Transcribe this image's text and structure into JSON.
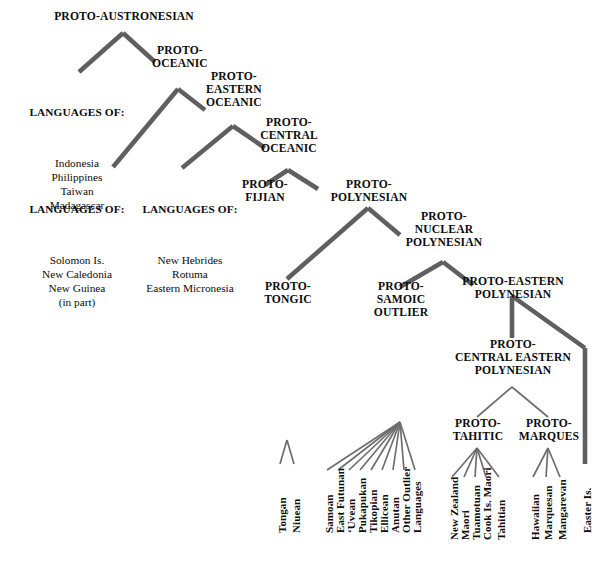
{
  "colors": {
    "background": "#ffffff",
    "text": "#0d0d0d",
    "thick_line": "#5f5f5f",
    "thin_line": "#6e6e6e"
  },
  "nodes": {
    "proto_austronesian": {
      "label": "PROTO-AUSTRONESIAN"
    },
    "proto_oceanic": {
      "label": "PROTO-\nOCEANIC"
    },
    "proto_eastern_oceanic": {
      "label": "PROTO-\nEASTERN\nOCEANIC"
    },
    "proto_central_oceanic": {
      "label": "PROTO-\nCENTRAL\nOCEANIC"
    },
    "proto_fijian": {
      "label": "PROTO-\nFIJIAN"
    },
    "proto_polynesian": {
      "label": "PROTO-\nPOLYNESIAN"
    },
    "proto_nuclear_polynesian": {
      "label": "PROTO-\nNUCLEAR\nPOLYNESIAN"
    },
    "proto_tongic": {
      "label": "PROTO-\nTONGIC"
    },
    "proto_samoic_outlier": {
      "label": "PROTO-\nSAMOIC\nOUTLIER"
    },
    "proto_eastern_polynesian": {
      "label": "PROTO-EASTERN\nPOLYNESIAN"
    },
    "proto_central_eastern_polynesian": {
      "label": "PROTO-\nCENTRAL EASTERN\nPOLYNESIAN"
    },
    "proto_tahitic": {
      "label": "PROTO-\nTAHITIC"
    },
    "proto_marques": {
      "label": "PROTO-\nMARQUES"
    }
  },
  "groups": {
    "western": {
      "heading": "LANGUAGES OF:",
      "members": [
        "Indonesia",
        "Philippines",
        "Taiwan",
        "Madagascar"
      ]
    },
    "melanesian": {
      "heading": "LANGUAGES OF:",
      "members": [
        "Solomon Is.",
        "New Caledonia",
        "New Guinea",
        "(in part)"
      ]
    },
    "eastern_oceanic_langs": {
      "heading": "LANGUAGES OF:",
      "members": [
        "New Hebrides",
        "Rotuma",
        "Eastern Micronesia"
      ]
    }
  },
  "leaves": {
    "tongic": [
      "Tongan",
      "Niuean"
    ],
    "samoic_outlier": [
      "Samoan",
      "East Futunan",
      "ʻUvean",
      "Pukapukan",
      "Tikopian",
      "Ellicean",
      "Anutan",
      "Other Outlier\nLanguages"
    ],
    "tahitic": [
      "New Zealand\nMaori",
      "Tuamotuan",
      "Cook Is. Maori",
      "Tahitian"
    ],
    "marquesic": [
      "Hawaiian",
      "Marquesan",
      "Mangarevan"
    ],
    "eastern_direct": [
      "Easter Is."
    ]
  },
  "leaf_labels_flat": [
    "Tongan",
    "Niuean",
    "Samoan",
    "East Futunan",
    "ʻUvean",
    "Pukapukan",
    "Tikopian",
    "Ellicean",
    "Anutan",
    "Other Outlier",
    "Languages",
    "New Zealand",
    "Maori",
    "Tuamotuan",
    "Cook Is. Maori",
    "Tahitian",
    "Hawaiian",
    "Marquesan",
    "Mangarevan",
    "Easter Is."
  ]
}
